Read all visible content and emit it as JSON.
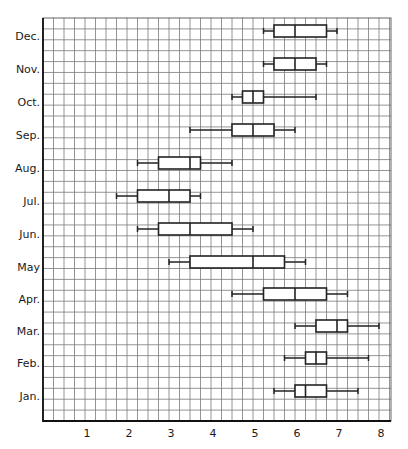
{
  "chart_data": {
    "type": "boxplot",
    "title": "",
    "xlabel": "",
    "ylabel": "",
    "xlim": [
      0,
      8.1
    ],
    "x_ticks": [
      "1",
      "2",
      "3",
      "4",
      "5",
      "6",
      "7",
      "8"
    ],
    "grid": true,
    "grid_step": 0.25,
    "orientation": "horizontal",
    "categories": [
      "Dec.",
      "Nov.",
      "Oct.",
      "Sep.",
      "Aug.",
      "Jul.",
      "Jun.",
      "May",
      "Apr.",
      "Mar.",
      "Feb.",
      "Jan."
    ],
    "series": [
      {
        "label": "Dec.",
        "min": 5.25,
        "q1": 5.5,
        "median": 6.0,
        "q3": 6.75,
        "max": 7.0
      },
      {
        "label": "Nov.",
        "min": 5.25,
        "q1": 5.5,
        "median": 6.0,
        "q3": 6.5,
        "max": 6.75
      },
      {
        "label": "Oct.",
        "min": 4.5,
        "q1": 4.75,
        "median": 5.0,
        "q3": 5.25,
        "max": 6.5
      },
      {
        "label": "Sep.",
        "min": 3.5,
        "q1": 4.5,
        "median": 5.0,
        "q3": 5.5,
        "max": 6.0
      },
      {
        "label": "Aug.",
        "min": 2.25,
        "q1": 2.75,
        "median": 3.5,
        "q3": 3.75,
        "max": 4.5
      },
      {
        "label": "Jul.",
        "min": 1.75,
        "q1": 2.25,
        "median": 3.0,
        "q3": 3.5,
        "max": 3.75
      },
      {
        "label": "Jun.",
        "min": 2.25,
        "q1": 2.75,
        "median": 3.5,
        "q3": 4.5,
        "max": 5.0
      },
      {
        "label": "May",
        "min": 3.0,
        "q1": 3.5,
        "median": 5.0,
        "q3": 5.75,
        "max": 6.25
      },
      {
        "label": "Apr.",
        "min": 4.5,
        "q1": 5.25,
        "median": 6.0,
        "q3": 6.75,
        "max": 7.25
      },
      {
        "label": "Mar.",
        "min": 6.0,
        "q1": 6.5,
        "median": 7.0,
        "q3": 7.25,
        "max": 8.0
      },
      {
        "label": "Feb.",
        "min": 5.75,
        "q1": 6.25,
        "median": 6.5,
        "q3": 6.75,
        "max": 7.75
      },
      {
        "label": "Jan.",
        "min": 5.5,
        "q1": 6.0,
        "median": 6.25,
        "q3": 6.75,
        "max": 7.5
      }
    ]
  },
  "layout": {
    "plot_left": 43,
    "plot_right": 391,
    "plot_top": 18,
    "plot_bottom": 421,
    "px_per_unit": 42,
    "origin_x": 43,
    "row_centers": [
      31,
      64,
      97,
      130,
      163,
      196,
      229,
      262,
      294,
      326,
      358,
      391
    ],
    "box_half_height": 6
  }
}
